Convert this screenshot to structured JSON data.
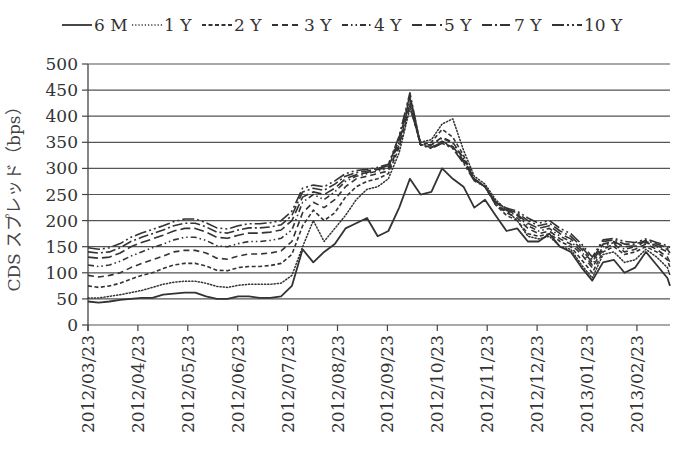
{
  "chart_data": {
    "type": "line",
    "title": "",
    "xlabel": "",
    "ylabel": "CDS スプレッド（bps）",
    "ylim": [
      0,
      500
    ],
    "yticks": [
      0,
      50,
      100,
      150,
      200,
      250,
      300,
      350,
      400,
      450,
      500
    ],
    "grid": true,
    "legend_position": "top",
    "x_tick_labels": [
      "2012/03/23",
      "2012/04/23",
      "2012/05/23",
      "2012/06/23",
      "2012/07/23",
      "2012/08/23",
      "2012/09/23",
      "2012/10/23",
      "2012/11/23",
      "2012/12/23",
      "2013/01/23",
      "2013/02/23"
    ],
    "x_frequency": "weekly",
    "x_start": "2012/03/23",
    "series": [
      {
        "name": "6 M",
        "style": "solid",
        "values": [
          45,
          43,
          45,
          48,
          50,
          52,
          52,
          58,
          60,
          62,
          62,
          55,
          50,
          50,
          55,
          55,
          52,
          52,
          55,
          75,
          145,
          120,
          140,
          155,
          185,
          195,
          205,
          170,
          180,
          225,
          280,
          250,
          255,
          300,
          280,
          265,
          225,
          240,
          210,
          180,
          185,
          160,
          160,
          175,
          150,
          140,
          110,
          85,
          120,
          125,
          100,
          110,
          140,
          115,
          90,
          75
        ]
      },
      {
        "name": "1 Y",
        "style": "dotted",
        "values": [
          52,
          52,
          55,
          58,
          62,
          66,
          72,
          78,
          82,
          84,
          84,
          80,
          74,
          72,
          76,
          78,
          78,
          78,
          80,
          95,
          150,
          200,
          160,
          185,
          210,
          240,
          260,
          265,
          280,
          330,
          415,
          350,
          355,
          385,
          395,
          335,
          285,
          270,
          240,
          220,
          200,
          170,
          165,
          170,
          150,
          145,
          115,
          90,
          135,
          140,
          120,
          125,
          145,
          130,
          110,
          95
        ]
      },
      {
        "name": "2 Y",
        "style": "dashed-short",
        "values": [
          75,
          72,
          75,
          80,
          88,
          95,
          100,
          108,
          115,
          118,
          118,
          113,
          105,
          104,
          110,
          112,
          112,
          114,
          118,
          135,
          190,
          220,
          200,
          215,
          245,
          265,
          275,
          280,
          290,
          340,
          420,
          345,
          350,
          375,
          360,
          325,
          280,
          265,
          230,
          210,
          200,
          175,
          170,
          175,
          160,
          150,
          125,
          100,
          140,
          150,
          135,
          140,
          150,
          140,
          125,
          110
        ]
      },
      {
        "name": "3 Y",
        "style": "dashed",
        "values": [
          95,
          92,
          95,
          100,
          110,
          118,
          125,
          132,
          140,
          143,
          143,
          138,
          128,
          126,
          132,
          136,
          136,
          138,
          142,
          160,
          215,
          235,
          225,
          240,
          265,
          280,
          285,
          290,
          295,
          345,
          425,
          345,
          345,
          360,
          350,
          320,
          280,
          265,
          230,
          215,
          205,
          185,
          175,
          180,
          165,
          155,
          135,
          110,
          145,
          155,
          140,
          145,
          155,
          145,
          130,
          120
        ]
      },
      {
        "name": "4 Y",
        "style": "dash-dot-dot",
        "values": [
          115,
          112,
          115,
          122,
          132,
          140,
          148,
          155,
          163,
          168,
          168,
          162,
          152,
          150,
          156,
          160,
          160,
          162,
          166,
          182,
          235,
          250,
          240,
          255,
          275,
          285,
          290,
          295,
          300,
          350,
          430,
          345,
          345,
          358,
          348,
          318,
          280,
          265,
          232,
          218,
          210,
          190,
          180,
          185,
          170,
          160,
          140,
          115,
          150,
          158,
          145,
          150,
          158,
          150,
          140,
          130
        ]
      },
      {
        "name": "5 Y",
        "style": "long-dash",
        "values": [
          130,
          128,
          130,
          138,
          150,
          158,
          165,
          172,
          180,
          185,
          185,
          178,
          168,
          166,
          172,
          176,
          176,
          178,
          182,
          200,
          245,
          255,
          250,
          262,
          280,
          288,
          292,
          298,
          302,
          355,
          435,
          345,
          340,
          352,
          342,
          315,
          278,
          265,
          235,
          220,
          212,
          195,
          185,
          190,
          175,
          165,
          145,
          120,
          155,
          160,
          150,
          152,
          160,
          152,
          145,
          138
        ]
      },
      {
        "name": "7 Y",
        "style": "dash-dot",
        "values": [
          140,
          138,
          140,
          148,
          160,
          168,
          175,
          182,
          190,
          195,
          195,
          188,
          178,
          176,
          182,
          186,
          186,
          188,
          192,
          210,
          255,
          262,
          258,
          270,
          285,
          292,
          295,
          300,
          305,
          360,
          440,
          345,
          340,
          350,
          340,
          312,
          278,
          265,
          235,
          222,
          215,
          200,
          190,
          195,
          180,
          170,
          150,
          125,
          160,
          163,
          155,
          155,
          162,
          155,
          148,
          142
        ]
      },
      {
        "name": "10 Y",
        "style": "dash-dot-dot-long",
        "values": [
          148,
          145,
          148,
          156,
          168,
          176,
          183,
          190,
          198,
          203,
          203,
          196,
          186,
          184,
          190,
          194,
          194,
          196,
          200,
          218,
          262,
          268,
          265,
          276,
          290,
          296,
          298,
          302,
          308,
          362,
          445,
          345,
          338,
          348,
          338,
          310,
          276,
          265,
          236,
          224,
          218,
          205,
          195,
          200,
          185,
          175,
          155,
          130,
          163,
          166,
          160,
          158,
          165,
          158,
          152,
          148
        ]
      }
    ]
  },
  "legend": {
    "items": [
      {
        "label": "6 M",
        "style": "solid"
      },
      {
        "label": "1 Y",
        "style": "dotted"
      },
      {
        "label": "2 Y",
        "style": "dashed-short"
      },
      {
        "label": "3 Y",
        "style": "dashed"
      },
      {
        "label": "4 Y",
        "style": "dash-dot-dot"
      },
      {
        "label": "5 Y",
        "style": "long-dash"
      },
      {
        "label": "7 Y",
        "style": "dash-dot"
      },
      {
        "label": "10 Y",
        "style": "dash-dot-dot-long"
      }
    ]
  },
  "colors": {
    "line": "#333333",
    "grid": "#555555",
    "axis": "#444444"
  }
}
